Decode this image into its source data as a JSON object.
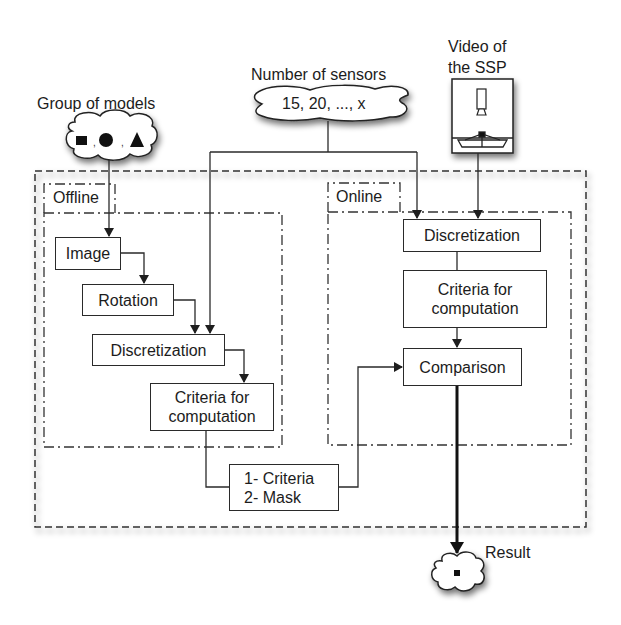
{
  "inputs": {
    "models": {
      "label": "Group of models",
      "shapes": [
        "square",
        "circle",
        "triangle"
      ],
      "separator": ","
    },
    "sensors": {
      "label": "Number of sensors",
      "values": "15, 20, ..., x"
    },
    "video": {
      "label_line1": "Video of",
      "label_line2": "the SSP"
    }
  },
  "offline": {
    "title": "Offline",
    "steps": [
      {
        "label": "Image"
      },
      {
        "label": "Rotation"
      },
      {
        "label": "Discretization"
      },
      {
        "label_line1": "Criteria for",
        "label_line2": "computation"
      }
    ]
  },
  "online": {
    "title": "Online",
    "steps": [
      {
        "label": "Discretization"
      },
      {
        "label_line1": "Criteria for",
        "label_line2": "computation"
      },
      {
        "label": "Comparison"
      }
    ]
  },
  "stored": {
    "line1": "1- Criteria",
    "line2": "2- Mask"
  },
  "output": {
    "label": "Result"
  },
  "colors": {
    "line": "#2a2a2a",
    "background": "#ffffff",
    "shadow": "#9a9a9a"
  }
}
